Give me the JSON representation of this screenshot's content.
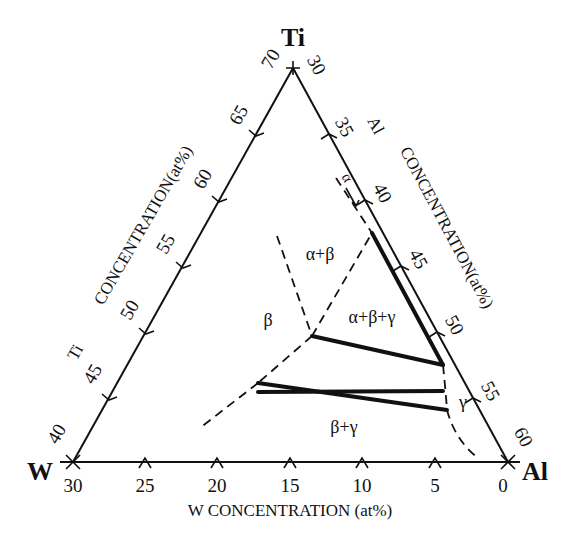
{
  "diagram": {
    "type": "ternary-phase-diagram",
    "corners": {
      "top": "Ti",
      "left": "W",
      "right": "Al"
    },
    "axes": {
      "left": {
        "title": "Ti CONCENTRATION(at%)",
        "title_prefix": "Ti",
        "title_main": "CONCENTRATION(at%)",
        "ticks": [
          "40",
          "45",
          "50",
          "55",
          "60",
          "65",
          "70"
        ]
      },
      "right": {
        "title": "Al CONCENTRATION(at%)",
        "title_prefix": "Al",
        "title_main": "CONCENTRATION(at%)",
        "ticks": [
          "30",
          "35",
          "40",
          "45",
          "50",
          "55",
          "60"
        ]
      },
      "bottom": {
        "title": "W CONCENTRATION (at%)",
        "ticks": [
          "30",
          "25",
          "20",
          "15",
          "10",
          "5",
          "0"
        ]
      }
    },
    "phase_labels": {
      "alpha": "α",
      "alpha_beta": "α+β",
      "beta": "β",
      "alpha_beta_gamma": "α+β+γ",
      "beta_gamma": "β+γ",
      "gamma": "γ"
    },
    "line_styles": {
      "tie_lines": "solid-thick",
      "phase_boundaries": "dashed"
    }
  }
}
